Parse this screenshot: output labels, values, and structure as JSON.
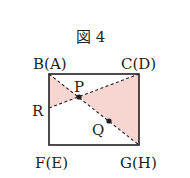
{
  "figure": {
    "title": "図 4",
    "labels": {
      "top_left": "B(A)",
      "top_right": "C(D)",
      "bottom_left": "F(E)",
      "bottom_right": "G(H)",
      "left_point": "R",
      "point_p": "P",
      "point_q": "Q"
    },
    "colors": {
      "shade": "#f7d6d1",
      "stroke": "#231f20"
    }
  }
}
